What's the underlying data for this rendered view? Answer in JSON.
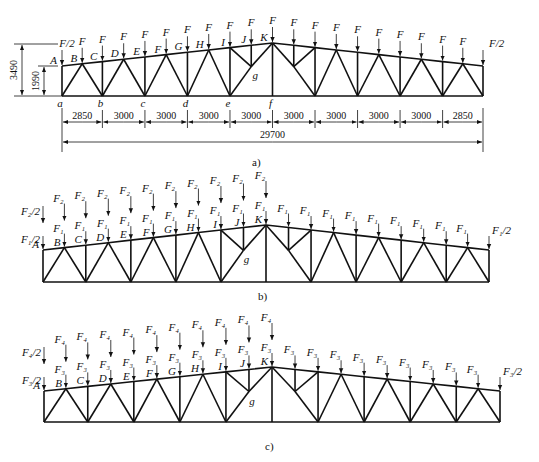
{
  "figure": {
    "type": "roof truss load diagrams",
    "panels": [
      {
        "id": "a",
        "caption": "a)",
        "dimensions": {
          "height_total": "3490",
          "height_end": "1990",
          "spans": [
            "2850",
            "3000",
            "3000",
            "3000",
            "3000",
            "3000",
            "3000",
            "3000",
            "3000",
            "2850"
          ],
          "total_span": "29700"
        },
        "top_nodes": [
          "A",
          "B",
          "C",
          "D",
          "E",
          "F",
          "G",
          "H",
          "I",
          "J",
          "K"
        ],
        "bottom_nodes": [
          "a",
          "b",
          "c",
          "d",
          "e",
          "f"
        ],
        "inner_node": "g",
        "loads": {
          "end": "F/2",
          "interior": "F"
        }
      },
      {
        "id": "b",
        "caption": "b)",
        "top_nodes": [
          "A",
          "B",
          "C",
          "D",
          "E",
          "F",
          "G",
          "H",
          "I",
          "J",
          "K"
        ],
        "inner_node": "g",
        "loads": {
          "left_only_end": "F₂/2",
          "left_only_interior": "F₂",
          "full_end": "F₁/2",
          "full_interior": "F₁"
        }
      },
      {
        "id": "c",
        "caption": "c)",
        "top_nodes": [
          "A",
          "B",
          "C",
          "D",
          "E",
          "F",
          "G",
          "H",
          "I",
          "J",
          "K"
        ],
        "inner_node": "g",
        "loads": {
          "left_only_end": "F₄/2",
          "left_only_interior": "F₄",
          "full_end": "F₃/2",
          "full_interior": "F₃"
        }
      }
    ]
  },
  "colors": {
    "ink": "#111111",
    "background": "#ffffff"
  }
}
